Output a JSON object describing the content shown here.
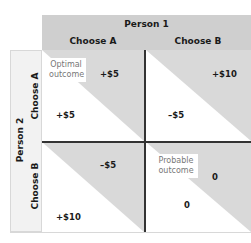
{
  "header": {
    "player_top": "Person 1",
    "columns": [
      {
        "label": "Choose A"
      },
      {
        "label": "Choose B"
      }
    ]
  },
  "side": {
    "player_left": "Person 2",
    "rows": [
      {
        "label": "Choose A"
      },
      {
        "label": "Choose B"
      }
    ]
  },
  "cells": [
    {
      "row": "A",
      "col": "A",
      "person1_payoff": "+$5",
      "person2_payoff": "+$5",
      "annotation": "Optimal outcome"
    },
    {
      "row": "A",
      "col": "B",
      "person1_payoff": "+$10",
      "person2_payoff": "–$5"
    },
    {
      "row": "B",
      "col": "A",
      "person1_payoff": "–$5",
      "person2_payoff": "+$10"
    },
    {
      "row": "B",
      "col": "B",
      "person1_payoff": "0",
      "person2_payoff": "0",
      "annotation": "Probable outcome"
    }
  ],
  "colors": {
    "header_bg": "#cfcfcf",
    "shade": "#d9d9d9",
    "side_bg": "#f2f2f2",
    "divider": "#333333"
  }
}
